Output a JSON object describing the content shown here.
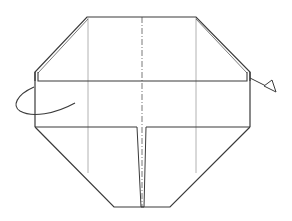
{
  "diagram": {
    "type": "origami-fold-diagram",
    "colors": {
      "outline": "#3a3a3a",
      "thin_line": "#9a9a9a",
      "center_line": "#6a6a6a",
      "background": "#ffffff"
    },
    "elements": {
      "outline": "octagonal paper model outline",
      "top_band": "folded band along upper edge",
      "center_crease": "dash-dot valley/mountain fold line down the middle",
      "vertical_creases": "two thin vertical crease lines",
      "slit": "narrow vertical slit from lower band to bottom edge",
      "turn_over_arrow": "curved arrow on left indicating turn over",
      "fold_arrow": "hollow arrowhead on right indicating fold behind"
    }
  }
}
